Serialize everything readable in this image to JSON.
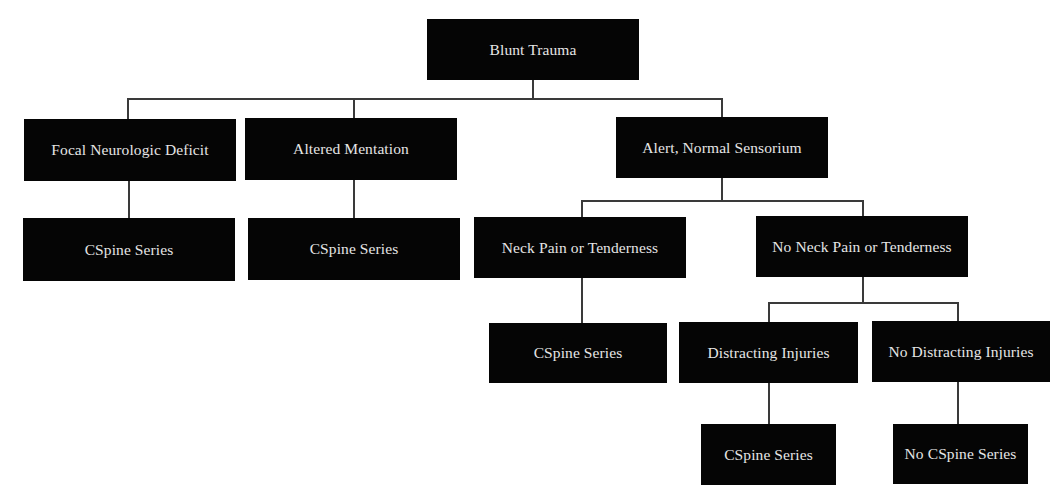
{
  "diagram": {
    "type": "decision-tree",
    "colors": {
      "node_fill": "#050505",
      "node_text": "#e6e6e6",
      "connector": "#3a3a3a",
      "background": "#ffffff"
    },
    "root": {
      "label": "Blunt Trauma"
    },
    "level1": [
      {
        "label": "Focal Neurologic Deficit",
        "outcome": "CSpine Series"
      },
      {
        "label": "Altered Mentation",
        "outcome": "CSpine Series"
      },
      {
        "label": "Alert, Normal Sensorium"
      }
    ],
    "alert_branch": [
      {
        "label": "Neck Pain or Tenderness",
        "outcome": "CSpine Series"
      },
      {
        "label": "No Neck Pain or Tenderness"
      }
    ],
    "no_neck_pain_branch": [
      {
        "label": "Distracting Injuries",
        "outcome": "CSpine Series"
      },
      {
        "label": "No Distracting Injuries",
        "outcome": "No CSpine Series"
      }
    ]
  }
}
